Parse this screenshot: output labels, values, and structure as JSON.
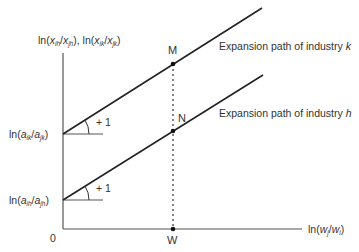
{
  "diagram": {
    "type": "line-diagram",
    "y_axis_label": {
      "prefix": "ln",
      "part1_num": "x",
      "part1_num_sub": "ih",
      "part1_den": "x",
      "part1_den_sub": "jh",
      "part2_num": "x",
      "part2_num_sub": "ik",
      "part2_den": "x",
      "part2_den_sub": "jk"
    },
    "x_axis_label": {
      "prefix": "ln",
      "num": "w",
      "num_sub": "j",
      "den": "w",
      "den_sub": "i"
    },
    "origin_label": "0",
    "intercepts": [
      {
        "id": "k",
        "prefix": "ln",
        "num": "a",
        "num_sub": "ik",
        "den": "a",
        "den_sub": "jk"
      },
      {
        "id": "h",
        "prefix": "ln",
        "num": "a",
        "num_sub": "ih",
        "den": "a",
        "den_sub": "jh"
      }
    ],
    "slope_labels": [
      "+ 1",
      "+ 1"
    ],
    "lines": [
      {
        "label_text": "Expansion path of industry ",
        "label_var": "k"
      },
      {
        "label_text": "Expansion path of industry ",
        "label_var": "h"
      }
    ],
    "points": {
      "M": "M",
      "N": "N",
      "W": "W"
    },
    "colors": {
      "line": "#222222",
      "axis": "#555555",
      "text": "#333333"
    }
  }
}
